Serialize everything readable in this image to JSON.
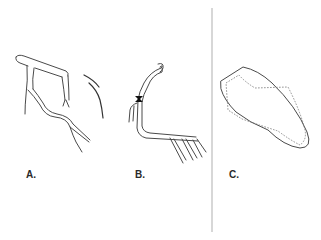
{
  "figure": {
    "panels": [
      {
        "id": "a",
        "label": "A.",
        "description": "coronary artery branching sketch"
      },
      {
        "id": "b",
        "label": "B.",
        "description": "coronary artery with stenosis"
      },
      {
        "id": "c",
        "label": "C.",
        "description": "ventricle outline with dashed inner contour"
      }
    ]
  },
  "colors": {
    "line": "#4a4a4a",
    "divider": "#bdbdbd",
    "stenosis": "#111111",
    "dashed": "#777777",
    "background": "#ffffff"
  }
}
